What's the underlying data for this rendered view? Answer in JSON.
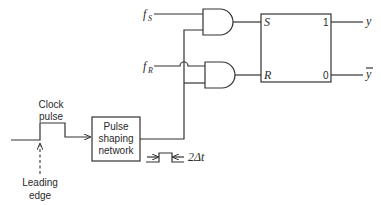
{
  "diagram": {
    "inputs": {
      "fs_main": "f",
      "fs_sub": "S",
      "fr_main": "f",
      "fr_sub": "R"
    },
    "flipflop": {
      "s_label": "S",
      "r_label": "R",
      "out1_label": "1",
      "out0_label": "0"
    },
    "outputs": {
      "y": "y",
      "ybar": "y"
    },
    "clock": {
      "line1": "Clock",
      "line2": "pulse"
    },
    "leading_edge": {
      "line1": "Leading",
      "line2": "edge"
    },
    "pulse_shaper": {
      "line1": "Pulse",
      "line2": "shaping",
      "line3": "network"
    },
    "pulse_width_label": "2Δt"
  }
}
